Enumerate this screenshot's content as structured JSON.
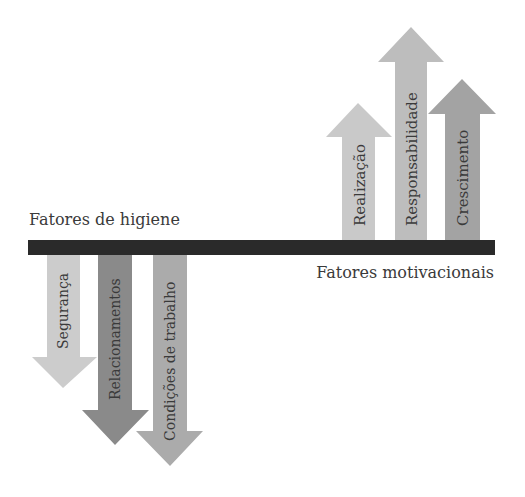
{
  "labels": {
    "hygiene": "Fatores de higiene",
    "motivational": "Fatores motivacionais"
  },
  "colors": {
    "bar": "#2a2a2a",
    "text": "#3a3a3a"
  },
  "motivational_arrows": [
    {
      "label": "Realização",
      "color": "#c9c9c9"
    },
    {
      "label": "Responsabilidade",
      "color": "#bdbdbd"
    },
    {
      "label": "Crescimento",
      "color": "#a3a3a3"
    }
  ],
  "hygiene_arrows": [
    {
      "label": "Segurança",
      "color": "#cccccc"
    },
    {
      "label": "Relacionamentos",
      "color": "#8a8a8a"
    },
    {
      "label": "Condições de trabalho",
      "color": "#ababab"
    }
  ],
  "caption": ""
}
